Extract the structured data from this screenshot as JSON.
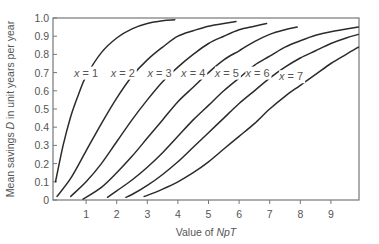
{
  "chart_data": {
    "type": "line",
    "title": "",
    "xlabel": "Value of NpT",
    "xlabel_parts": [
      {
        "text": "Value of ",
        "italic": false
      },
      {
        "text": "NpT",
        "italic": true
      }
    ],
    "ylabel": "Mean savings D in unit years per year",
    "ylabel_parts": [
      {
        "text": "Mean savings ",
        "italic": false
      },
      {
        "text": "D",
        "italic": true
      },
      {
        "text": " in unit years per year",
        "italic": false
      }
    ],
    "xlim": [
      0,
      9.9
    ],
    "ylim": [
      0,
      1.0
    ],
    "xticks": [
      1,
      2,
      3,
      4,
      5,
      6,
      7,
      8,
      9
    ],
    "yticks": [
      0,
      0.1,
      0.2,
      0.3,
      0.4,
      0.5,
      0.6,
      0.7,
      0.8,
      0.9,
      1.0
    ],
    "ytick_labels": [
      "0",
      "0.1",
      "0.2",
      "0.3",
      "0.4",
      "0.5",
      "0.6",
      "0.7",
      "0.8",
      "0.9",
      "1.0"
    ],
    "grid": false,
    "legend": "none (inline curve labels)",
    "series": [
      {
        "name": "x = 1",
        "label_var": "x",
        "label_val": "1",
        "label_pos": [
          1.0,
          0.7
        ],
        "points": [
          [
            0.0,
            0.1
          ],
          [
            0.25,
            0.3
          ],
          [
            0.5,
            0.46
          ],
          [
            0.75,
            0.58
          ],
          [
            1.0,
            0.68
          ],
          [
            1.5,
            0.81
          ],
          [
            2.0,
            0.89
          ],
          [
            2.5,
            0.94
          ],
          [
            3.0,
            0.97
          ],
          [
            3.5,
            0.985
          ],
          [
            3.9,
            0.99
          ]
        ]
      },
      {
        "name": "x = 2",
        "label_var": "x",
        "label_val": "2",
        "label_pos": [
          2.2,
          0.7
        ],
        "points": [
          [
            0.05,
            0.02
          ],
          [
            0.5,
            0.12
          ],
          [
            1.0,
            0.27
          ],
          [
            1.5,
            0.42
          ],
          [
            2.0,
            0.56
          ],
          [
            2.5,
            0.68
          ],
          [
            3.0,
            0.77
          ],
          [
            3.5,
            0.84
          ],
          [
            4.0,
            0.9
          ],
          [
            4.5,
            0.93
          ],
          [
            5.0,
            0.955
          ],
          [
            5.5,
            0.97
          ],
          [
            5.9,
            0.98
          ]
        ]
      },
      {
        "name": "x = 3",
        "label_var": "x",
        "label_val": "3",
        "label_pos": [
          3.4,
          0.7
        ],
        "points": [
          [
            0.5,
            0.02
          ],
          [
            1.0,
            0.1
          ],
          [
            1.5,
            0.2
          ],
          [
            2.0,
            0.32
          ],
          [
            2.5,
            0.44
          ],
          [
            3.0,
            0.55
          ],
          [
            3.5,
            0.65
          ],
          [
            4.0,
            0.73
          ],
          [
            4.5,
            0.8
          ],
          [
            5.0,
            0.86
          ],
          [
            5.5,
            0.9
          ],
          [
            6.0,
            0.935
          ],
          [
            6.5,
            0.955
          ],
          [
            6.9,
            0.97
          ]
        ]
      },
      {
        "name": "x = 4",
        "label_var": "x",
        "label_val": "4",
        "label_pos": [
          4.5,
          0.7
        ],
        "points": [
          [
            0.9,
            0.005
          ],
          [
            1.5,
            0.07
          ],
          [
            2.0,
            0.15
          ],
          [
            2.5,
            0.24
          ],
          [
            3.0,
            0.34
          ],
          [
            3.5,
            0.44
          ],
          [
            4.0,
            0.54
          ],
          [
            4.5,
            0.62
          ],
          [
            5.0,
            0.7
          ],
          [
            5.5,
            0.77
          ],
          [
            6.0,
            0.82
          ],
          [
            6.5,
            0.87
          ],
          [
            7.0,
            0.91
          ],
          [
            7.5,
            0.935
          ],
          [
            7.9,
            0.95
          ]
        ]
      },
      {
        "name": "x = 5",
        "label_var": "x",
        "label_val": "5",
        "label_pos": [
          5.6,
          0.7
        ],
        "points": [
          [
            1.7,
            0.015
          ],
          [
            2.0,
            0.05
          ],
          [
            2.5,
            0.11
          ],
          [
            3.0,
            0.18
          ],
          [
            3.5,
            0.26
          ],
          [
            4.0,
            0.35
          ],
          [
            4.5,
            0.44
          ],
          [
            5.0,
            0.52
          ],
          [
            5.5,
            0.6
          ],
          [
            6.0,
            0.67
          ],
          [
            6.5,
            0.74
          ],
          [
            7.0,
            0.79
          ],
          [
            7.5,
            0.84
          ],
          [
            8.0,
            0.875
          ],
          [
            8.5,
            0.905
          ],
          [
            9.0,
            0.925
          ],
          [
            9.5,
            0.94
          ],
          [
            9.9,
            0.95
          ]
        ]
      },
      {
        "name": "x = 6",
        "label_var": "x",
        "label_val": "6",
        "label_pos": [
          6.6,
          0.7
        ],
        "points": [
          [
            2.3,
            0.015
          ],
          [
            2.5,
            0.03
          ],
          [
            3.0,
            0.08
          ],
          [
            3.5,
            0.14
          ],
          [
            4.0,
            0.21
          ],
          [
            4.5,
            0.29
          ],
          [
            5.0,
            0.37
          ],
          [
            5.5,
            0.45
          ],
          [
            6.0,
            0.53
          ],
          [
            6.5,
            0.6
          ],
          [
            7.0,
            0.67
          ],
          [
            7.5,
            0.73
          ],
          [
            8.0,
            0.78
          ],
          [
            8.5,
            0.82
          ],
          [
            9.0,
            0.86
          ],
          [
            9.5,
            0.89
          ],
          [
            9.9,
            0.91
          ]
        ]
      },
      {
        "name": "x = 7",
        "label_var": "x",
        "label_val": "7",
        "label_pos": [
          7.7,
          0.68
        ],
        "points": [
          [
            2.9,
            0.02
          ],
          [
            3.0,
            0.025
          ],
          [
            3.5,
            0.06
          ],
          [
            4.0,
            0.1
          ],
          [
            4.5,
            0.15
          ],
          [
            5.0,
            0.21
          ],
          [
            5.5,
            0.28
          ],
          [
            6.0,
            0.35
          ],
          [
            6.5,
            0.42
          ],
          [
            7.0,
            0.5
          ],
          [
            7.5,
            0.57
          ],
          [
            8.0,
            0.63
          ],
          [
            8.5,
            0.69
          ],
          [
            9.0,
            0.75
          ],
          [
            9.5,
            0.8
          ],
          [
            9.9,
            0.84
          ]
        ]
      }
    ]
  },
  "colors": {
    "curve": "#2b2b2b",
    "axis": "#777777",
    "text": "#555555",
    "background": "#ffffff"
  }
}
